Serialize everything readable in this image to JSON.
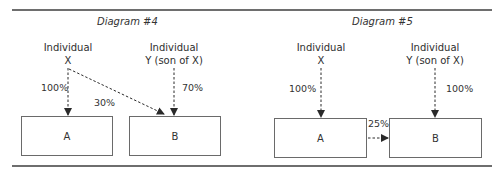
{
  "diagrams": [
    {
      "title": "Diagram #4",
      "individual_x": {
        "line1": "Individual",
        "line2": "X"
      },
      "individual_y": {
        "line1": "Individual",
        "line2": "Y (son of X)"
      },
      "box_a": "A",
      "box_b": "B",
      "edges": [
        {
          "from": "Individual X",
          "to": "A",
          "label": "100%"
        },
        {
          "from": "Individual X",
          "to": "B",
          "label": "30%"
        },
        {
          "from": "Individual Y (son of X)",
          "to": "B",
          "label": "70%"
        }
      ]
    },
    {
      "title": "Diagram #5",
      "individual_x": {
        "line1": "Individual",
        "line2": "X"
      },
      "individual_y": {
        "line1": "Individual",
        "line2": "Y (son of X)"
      },
      "box_a": "A",
      "box_b": "B",
      "edges": [
        {
          "from": "Individual X",
          "to": "A",
          "label": "100%"
        },
        {
          "from": "Individual Y (son of X)",
          "to": "B",
          "label": "100%"
        },
        {
          "from": "A",
          "to": "B",
          "label": "25%"
        }
      ]
    }
  ],
  "colors": {
    "rule": "#6e6e6e",
    "box_border": "#6a6a6a",
    "arrow": "#2a2a2a",
    "text": "#2e2e2e"
  }
}
